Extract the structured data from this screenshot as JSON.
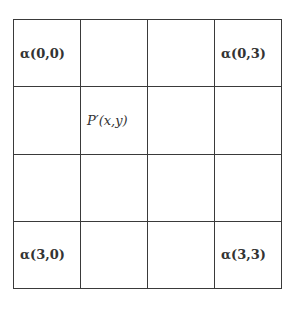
{
  "diagram": {
    "type": "4x4 grid",
    "rows": [
      [
        "α(0,0)",
        "",
        "",
        "α(0,3)"
      ],
      [
        "",
        "P′(x,y)",
        "",
        ""
      ],
      [
        "",
        "",
        "",
        ""
      ],
      [
        "α(3,0)",
        "",
        "",
        "α(3,3)"
      ]
    ],
    "labels": {
      "a00": "α(0,0)",
      "a03": "α(0,3)",
      "p": "P′(x,y)",
      "a30": "α(3,0)",
      "a33": "α(3,3)"
    },
    "line_color": "#3a3a3a",
    "text_color": "#333333"
  }
}
